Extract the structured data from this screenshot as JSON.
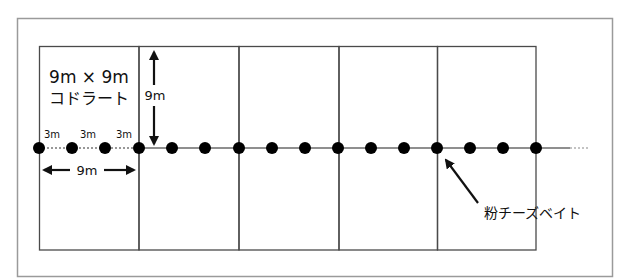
{
  "diagram": {
    "title_line1": "9m × 9m",
    "title_line2": "コドラート",
    "vertical_dimension_label": "9m",
    "horizontal_dimension_label": "9m",
    "spacing_labels": [
      "3m",
      "3m",
      "3m"
    ],
    "bait_label": "粉チーズベイト",
    "quadrat_count": 5,
    "quadrat_size_m": 9,
    "bait_spacing_m": 3,
    "colors": {
      "frame": "#9a9a9a",
      "quadrat_lines": "#4a4a4a",
      "bait_dot": "#000000",
      "transect_line": "#6a6a6a"
    }
  }
}
